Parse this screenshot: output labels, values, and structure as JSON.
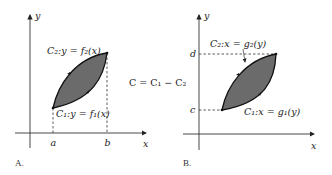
{
  "figure": {
    "center_label": "C = C₁ − C₂",
    "panel_a": {
      "caption": "A.",
      "y_axis_label": "y",
      "x_axis_label": "x",
      "tick_a": "a",
      "tick_b": "b",
      "upper_curve_label": "C₂:y = f₂(x)",
      "lower_curve_label": "C₁:y = f₁(x)",
      "region_color": "#6b6b6b"
    },
    "panel_b": {
      "caption": "B.",
      "y_axis_label": "y",
      "x_axis_label": "x",
      "tick_d": "d",
      "tick_c": "c",
      "upper_curve_label": "C₂:x = g₂(y)",
      "lower_curve_label": "C₁:x = g₁(y)",
      "region_color": "#6b6b6b"
    }
  }
}
